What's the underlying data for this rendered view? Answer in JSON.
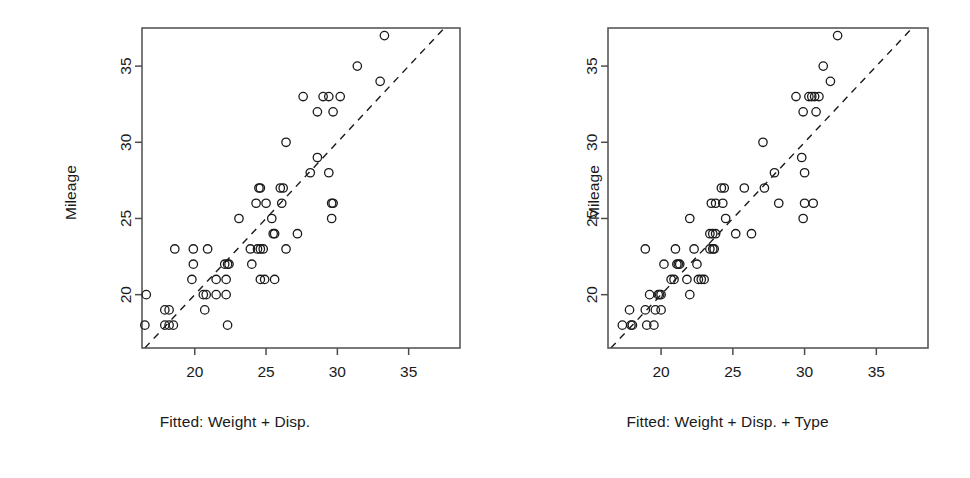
{
  "figure": {
    "background": "#ffffff",
    "marker_color": "#1a1a1a",
    "axis_color": "#4d4d4d",
    "reference_line_color": "#1a1a1a"
  },
  "panels": [
    {
      "id": "left",
      "y_axis_title": "Mileage",
      "x_axis_title": "Fitted: Weight + Disp.",
      "x_ticks": [
        "20",
        "25",
        "30",
        "35"
      ],
      "y_ticks": [
        "20",
        "25",
        "30",
        "35"
      ]
    },
    {
      "id": "right",
      "y_axis_title": "Mileage",
      "x_axis_title": "Fitted: Weight + Disp. + Type",
      "x_ticks": [
        "20",
        "25",
        "30",
        "35"
      ],
      "y_ticks": [
        "20",
        "25",
        "30",
        "35"
      ]
    }
  ],
  "chart_data": [
    {
      "type": "scatter",
      "title": "",
      "xlabel": "Fitted: Weight + Disp.",
      "ylabel": "Mileage",
      "xlim": [
        16.3,
        38.6
      ],
      "ylim": [
        16.5,
        37.5
      ],
      "xticks": [
        20,
        25,
        30,
        35
      ],
      "yticks": [
        20,
        25,
        30,
        35
      ],
      "grid": false,
      "legend": "none",
      "annotations": [
        {
          "type": "line",
          "style": "dashed",
          "description": "y = x reference line"
        }
      ],
      "points": [
        {
          "x": 16.6,
          "y": 20
        },
        {
          "x": 16.5,
          "y": 18
        },
        {
          "x": 17.9,
          "y": 19
        },
        {
          "x": 18.2,
          "y": 19
        },
        {
          "x": 17.9,
          "y": 18
        },
        {
          "x": 18.2,
          "y": 18
        },
        {
          "x": 18.5,
          "y": 18
        },
        {
          "x": 18.6,
          "y": 23
        },
        {
          "x": 19.9,
          "y": 23
        },
        {
          "x": 20.9,
          "y": 23
        },
        {
          "x": 19.9,
          "y": 22
        },
        {
          "x": 19.8,
          "y": 21
        },
        {
          "x": 20.6,
          "y": 20
        },
        {
          "x": 20.8,
          "y": 20
        },
        {
          "x": 20.7,
          "y": 19
        },
        {
          "x": 21.5,
          "y": 20
        },
        {
          "x": 21.5,
          "y": 21
        },
        {
          "x": 22.2,
          "y": 21
        },
        {
          "x": 22.1,
          "y": 22
        },
        {
          "x": 22.3,
          "y": 22
        },
        {
          "x": 22.4,
          "y": 22
        },
        {
          "x": 22.2,
          "y": 20
        },
        {
          "x": 22.3,
          "y": 18
        },
        {
          "x": 23.1,
          "y": 25
        },
        {
          "x": 23.9,
          "y": 23
        },
        {
          "x": 24.4,
          "y": 23
        },
        {
          "x": 24.6,
          "y": 23
        },
        {
          "x": 24.8,
          "y": 23
        },
        {
          "x": 24.0,
          "y": 22
        },
        {
          "x": 24.3,
          "y": 26
        },
        {
          "x": 24.5,
          "y": 27
        },
        {
          "x": 24.6,
          "y": 27
        },
        {
          "x": 25.0,
          "y": 26
        },
        {
          "x": 24.6,
          "y": 21
        },
        {
          "x": 24.9,
          "y": 21
        },
        {
          "x": 25.6,
          "y": 21
        },
        {
          "x": 25.5,
          "y": 24
        },
        {
          "x": 25.6,
          "y": 24
        },
        {
          "x": 25.4,
          "y": 25
        },
        {
          "x": 26.0,
          "y": 27
        },
        {
          "x": 26.2,
          "y": 27
        },
        {
          "x": 26.1,
          "y": 26
        },
        {
          "x": 26.4,
          "y": 30
        },
        {
          "x": 26.4,
          "y": 23
        },
        {
          "x": 27.2,
          "y": 24
        },
        {
          "x": 27.6,
          "y": 33
        },
        {
          "x": 28.1,
          "y": 28
        },
        {
          "x": 28.6,
          "y": 32
        },
        {
          "x": 28.6,
          "y": 29
        },
        {
          "x": 29.0,
          "y": 33
        },
        {
          "x": 29.4,
          "y": 33
        },
        {
          "x": 29.4,
          "y": 28
        },
        {
          "x": 29.6,
          "y": 26
        },
        {
          "x": 29.7,
          "y": 26
        },
        {
          "x": 29.6,
          "y": 25
        },
        {
          "x": 29.7,
          "y": 32
        },
        {
          "x": 30.2,
          "y": 33
        },
        {
          "x": 31.4,
          "y": 35
        },
        {
          "x": 33.0,
          "y": 34
        },
        {
          "x": 33.3,
          "y": 37
        }
      ]
    },
    {
      "type": "scatter",
      "title": "",
      "xlabel": "Fitted: Weight + Disp. + Type",
      "ylabel": "Mileage",
      "xlim": [
        16.3,
        38.6
      ],
      "ylim": [
        16.5,
        37.5
      ],
      "xticks": [
        20,
        25,
        30,
        35
      ],
      "yticks": [
        20,
        25,
        30,
        35
      ],
      "grid": false,
      "legend": "none",
      "annotations": [
        {
          "type": "line",
          "style": "dashed",
          "description": "y = x reference line"
        }
      ],
      "points": [
        {
          "x": 17.3,
          "y": 18
        },
        {
          "x": 17.9,
          "y": 18
        },
        {
          "x": 17.8,
          "y": 19
        },
        {
          "x": 18.0,
          "y": 18
        },
        {
          "x": 19.0,
          "y": 18
        },
        {
          "x": 19.5,
          "y": 18
        },
        {
          "x": 18.9,
          "y": 19
        },
        {
          "x": 19.6,
          "y": 19
        },
        {
          "x": 20.0,
          "y": 19
        },
        {
          "x": 19.2,
          "y": 20
        },
        {
          "x": 19.8,
          "y": 20
        },
        {
          "x": 19.9,
          "y": 20
        },
        {
          "x": 20.0,
          "y": 20
        },
        {
          "x": 18.9,
          "y": 23
        },
        {
          "x": 20.2,
          "y": 22
        },
        {
          "x": 20.7,
          "y": 21
        },
        {
          "x": 20.9,
          "y": 21
        },
        {
          "x": 21.1,
          "y": 22
        },
        {
          "x": 21.2,
          "y": 22
        },
        {
          "x": 21.3,
          "y": 22
        },
        {
          "x": 21.0,
          "y": 23
        },
        {
          "x": 21.8,
          "y": 21
        },
        {
          "x": 22.0,
          "y": 25
        },
        {
          "x": 22.0,
          "y": 20
        },
        {
          "x": 22.3,
          "y": 23
        },
        {
          "x": 22.5,
          "y": 22
        },
        {
          "x": 22.6,
          "y": 21
        },
        {
          "x": 22.8,
          "y": 21
        },
        {
          "x": 23.0,
          "y": 21
        },
        {
          "x": 23.4,
          "y": 23
        },
        {
          "x": 23.6,
          "y": 23
        },
        {
          "x": 23.7,
          "y": 23
        },
        {
          "x": 23.4,
          "y": 24
        },
        {
          "x": 23.6,
          "y": 24
        },
        {
          "x": 23.8,
          "y": 24
        },
        {
          "x": 23.5,
          "y": 26
        },
        {
          "x": 23.8,
          "y": 26
        },
        {
          "x": 24.2,
          "y": 27
        },
        {
          "x": 24.4,
          "y": 27
        },
        {
          "x": 24.3,
          "y": 26
        },
        {
          "x": 24.5,
          "y": 25
        },
        {
          "x": 25.2,
          "y": 24
        },
        {
          "x": 25.8,
          "y": 27
        },
        {
          "x": 26.3,
          "y": 24
        },
        {
          "x": 27.1,
          "y": 30
        },
        {
          "x": 27.2,
          "y": 27
        },
        {
          "x": 27.9,
          "y": 28
        },
        {
          "x": 28.2,
          "y": 26
        },
        {
          "x": 29.4,
          "y": 33
        },
        {
          "x": 29.8,
          "y": 29
        },
        {
          "x": 29.9,
          "y": 32
        },
        {
          "x": 30.0,
          "y": 26
        },
        {
          "x": 29.9,
          "y": 25
        },
        {
          "x": 30.0,
          "y": 28
        },
        {
          "x": 30.3,
          "y": 33
        },
        {
          "x": 30.5,
          "y": 33
        },
        {
          "x": 30.7,
          "y": 33
        },
        {
          "x": 30.6,
          "y": 26
        },
        {
          "x": 30.8,
          "y": 32
        },
        {
          "x": 31.0,
          "y": 33
        },
        {
          "x": 31.3,
          "y": 35
        },
        {
          "x": 31.8,
          "y": 34
        },
        {
          "x": 32.3,
          "y": 37
        }
      ]
    }
  ]
}
